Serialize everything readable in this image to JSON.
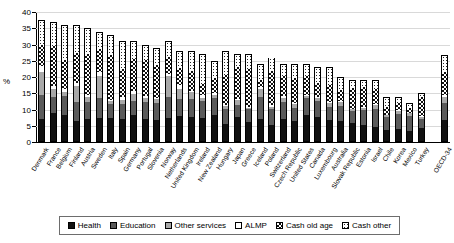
{
  "chart_data": {
    "type": "bar",
    "stacked": true,
    "title": "",
    "xlabel": "",
    "ylabel": "%",
    "ylim": [
      0,
      40
    ],
    "yticks": [
      0,
      5,
      10,
      15,
      20,
      25,
      30,
      35,
      40
    ],
    "grid": true,
    "legend_position": "bottom",
    "categories": [
      "Denmark",
      "France",
      "Belgium",
      "Finland",
      "Austria",
      "Sweden",
      "Italy",
      "Spain",
      "Germany",
      "Portugal",
      "Slovenia",
      "Norway",
      "Netherlands",
      "United Kingdom",
      "Ireland",
      "New Zealand",
      "Hungary",
      "Japan",
      "Greece",
      "Iceland",
      "Poland",
      "Switzerland",
      "Czech Republic",
      "United States",
      "Canada",
      "Luxembourg",
      "Australia",
      "Slovak Republic",
      "Estonia",
      "Israel",
      "Chile",
      "Korea",
      "Mexico",
      "Turkey",
      "OECD-34"
    ],
    "series": [
      {
        "name": "Health",
        "values": [
          7.0,
          8.8,
          8.1,
          6.3,
          7.0,
          7.1,
          7.1,
          6.9,
          8.1,
          6.9,
          6.6,
          7.3,
          8.0,
          7.7,
          7.2,
          8.3,
          5.2,
          7.5,
          6.0,
          7.0,
          5.1,
          7.0,
          6.3,
          8.3,
          7.7,
          6.6,
          6.2,
          5.8,
          5.0,
          4.5,
          3.6,
          4.0,
          3.1,
          4.3,
          6.5
        ]
      },
      {
        "name": "Education",
        "values": [
          7.5,
          5.0,
          5.9,
          6.0,
          5.2,
          6.5,
          4.4,
          4.7,
          4.4,
          5.5,
          5.3,
          6.6,
          5.2,
          5.5,
          5.3,
          5.2,
          4.9,
          3.8,
          4.0,
          6.8,
          5.0,
          5.2,
          4.1,
          5.3,
          5.0,
          4.0,
          4.8,
          3.7,
          5.0,
          5.7,
          4.0,
          4.8,
          5.1,
          2.9,
          5.4
        ]
      },
      {
        "name": "Other services",
        "values": [
          7.0,
          2.4,
          1.2,
          4.8,
          1.5,
          6.8,
          0.9,
          1.3,
          2.3,
          1.1,
          1.2,
          6.5,
          3.3,
          2.2,
          1.1,
          1.1,
          1.0,
          1.6,
          0.5,
          2.6,
          0.7,
          1.4,
          1.2,
          0.7,
          0.9,
          1.3,
          1.4,
          0.6,
          0.6,
          1.3,
          0.7,
          0.8,
          0.8,
          0.6,
          1.9
        ]
      },
      {
        "name": "ALMP",
        "values": [
          2.0,
          1.0,
          1.2,
          1.0,
          0.8,
          1.1,
          0.5,
          0.9,
          0.9,
          0.7,
          0.4,
          0.6,
          1.1,
          0.4,
          0.8,
          0.4,
          0.3,
          0.2,
          0.2,
          0.8,
          0.5,
          0.6,
          0.3,
          0.1,
          0.3,
          0.5,
          0.4,
          0.2,
          0.2,
          0.2,
          0.2,
          0.4,
          0.1,
          0.1,
          0.6
        ]
      },
      {
        "name": "Cash old age",
        "values": [
          6.5,
          12.5,
          9.0,
          9.5,
          12.9,
          7.4,
          14.2,
          8.9,
          10.0,
          11.3,
          10.4,
          5.5,
          5.4,
          6.2,
          3.7,
          4.8,
          9.3,
          10.2,
          12.1,
          2.0,
          10.9,
          6.4,
          8.1,
          6.2,
          4.3,
          5.4,
          3.5,
          6.5,
          6.4,
          4.9,
          2.6,
          2.1,
          1.6,
          6.3,
          7.4
        ]
      },
      {
        "name": "Cash other",
        "values": [
          7.5,
          7.3,
          10.6,
          8.4,
          7.6,
          5.1,
          5.9,
          8.3,
          5.3,
          4.5,
          5.1,
          4.5,
          5.0,
          6.0,
          8.9,
          5.2,
          7.3,
          3.7,
          4.2,
          4.8,
          3.8,
          3.4,
          4.0,
          3.4,
          4.8,
          5.2,
          3.7,
          2.2,
          1.8,
          2.4,
          2.9,
          1.9,
          1.3,
          0.8,
          4.9
        ]
      }
    ],
    "gap_before_last": true
  },
  "legend": {
    "items": [
      {
        "label": "Health",
        "pattern": "health"
      },
      {
        "label": "Education",
        "pattern": "education"
      },
      {
        "label": "Other services",
        "pattern": "other"
      },
      {
        "label": "ALMP",
        "pattern": "almp"
      },
      {
        "label": "Cash old age",
        "pattern": "cashold"
      },
      {
        "label": "Cash other",
        "pattern": "cashother"
      }
    ]
  },
  "colors": {
    "health": "#111111",
    "education": "#5a5a5a",
    "other_services": "#a8a8a8",
    "almp": "#ffffff",
    "cash_old_age": "#111111",
    "cash_other": "#2a2a2a",
    "grid": "#d9d9d9",
    "axis": "#000000"
  }
}
